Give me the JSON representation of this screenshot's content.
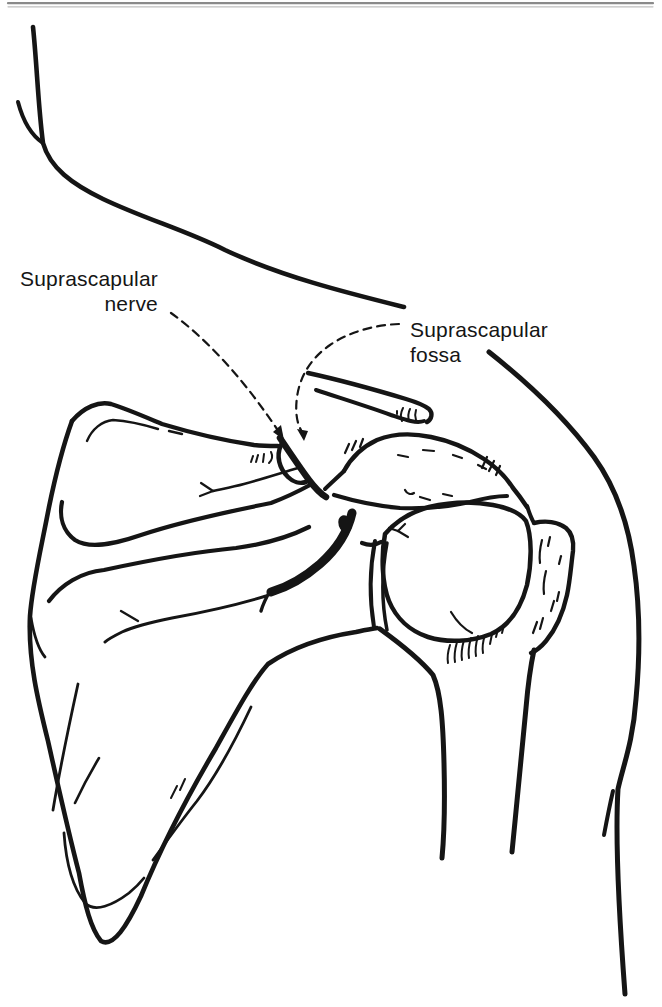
{
  "page": {
    "background": "#ffffff",
    "top_rule_color": "#8a8a8a",
    "ink_color": "#151515"
  },
  "figure": {
    "labels": {
      "nerve": {
        "line1": "Suprascapular",
        "line2": "nerve"
      },
      "fossa": {
        "line1": "Suprascapular",
        "line2": "fossa"
      }
    }
  }
}
